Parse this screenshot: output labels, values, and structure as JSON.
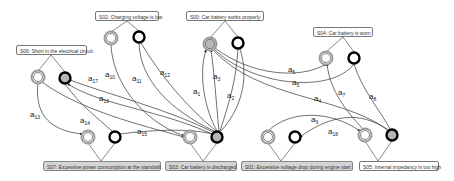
{
  "states": [
    {
      "id": "S00",
      "label": "S00: Car battery works properly",
      "box": {
        "x": 186,
        "y": 11,
        "w": 78
      },
      "style": "white"
    },
    {
      "id": "S02",
      "label": "S02: Charging voltage is low",
      "box": {
        "x": 95,
        "y": 11,
        "w": 64
      },
      "style": "white"
    },
    {
      "id": "S06",
      "label": "S06: Short in the electrical circuit",
      "box": {
        "x": 16,
        "y": 45,
        "w": 71
      },
      "style": "white"
    },
    {
      "id": "S04",
      "label": "S04: Car battery is worn",
      "box": {
        "x": 313,
        "y": 27,
        "w": 60
      },
      "style": "white"
    },
    {
      "id": "S07",
      "label": "S07: Excessive power consumption at the standstill",
      "box": {
        "x": 43,
        "y": 161,
        "w": 118
      },
      "style": "gray"
    },
    {
      "id": "S03",
      "label": "S03: Car battery is discharged",
      "box": {
        "x": 165,
        "y": 161,
        "w": 72
      },
      "style": "gray"
    },
    {
      "id": "S01",
      "label": "S01: Excessive voltage drop during engine start",
      "box": {
        "x": 241,
        "y": 161,
        "w": 112
      },
      "style": "gray"
    },
    {
      "id": "S05",
      "label": "S05: Internal impedancy is too high",
      "box": {
        "x": 359,
        "y": 161,
        "w": 80
      },
      "style": "white"
    }
  ],
  "nodes": [
    {
      "id": "S00-in",
      "cx": 210,
      "cy": 44,
      "type": "double-gray"
    },
    {
      "id": "S00-out",
      "cx": 238,
      "cy": 43,
      "type": "thick-white"
    },
    {
      "id": "S02-in",
      "cx": 111,
      "cy": 38,
      "type": "double-white"
    },
    {
      "id": "S02-out",
      "cx": 139,
      "cy": 37,
      "type": "thick-white"
    },
    {
      "id": "S06-in",
      "cx": 38,
      "cy": 77,
      "type": "double-white"
    },
    {
      "id": "S06-out",
      "cx": 65,
      "cy": 78,
      "type": "thick-gray"
    },
    {
      "id": "S04-in",
      "cx": 326,
      "cy": 58,
      "type": "double-white"
    },
    {
      "id": "S04-out",
      "cx": 354,
      "cy": 58,
      "type": "thick-white"
    },
    {
      "id": "S07-in",
      "cx": 88,
      "cy": 137,
      "type": "double-white"
    },
    {
      "id": "S07-out",
      "cx": 115,
      "cy": 137,
      "type": "thick-white"
    },
    {
      "id": "S03-in",
      "cx": 190,
      "cy": 137,
      "type": "double-white"
    },
    {
      "id": "S03-out",
      "cx": 217,
      "cy": 137,
      "type": "thick-gray"
    },
    {
      "id": "S01-in",
      "cx": 268,
      "cy": 137,
      "type": "double-white"
    },
    {
      "id": "S01-out",
      "cx": 295,
      "cy": 137,
      "type": "thick-white"
    },
    {
      "id": "S05-in",
      "cx": 365,
      "cy": 135,
      "type": "double-white"
    },
    {
      "id": "S05-out",
      "cx": 392,
      "cy": 135,
      "type": "thick-gray"
    }
  ],
  "edges": [
    {
      "name": "a1",
      "sub": "1",
      "lx": 193,
      "ly": 94
    },
    {
      "name": "a2",
      "sub": "2",
      "lx": 227,
      "ly": 98
    },
    {
      "name": "a3",
      "sub": "3",
      "lx": 213,
      "ly": 79
    },
    {
      "name": "a4",
      "sub": "4",
      "lx": 314,
      "ly": 101
    },
    {
      "name": "a5",
      "sub": "5",
      "lx": 292,
      "ly": 85
    },
    {
      "name": "a6",
      "sub": "6",
      "lx": 288,
      "ly": 72
    },
    {
      "name": "a7",
      "sub": "7",
      "lx": 338,
      "ly": 95
    },
    {
      "name": "a8",
      "sub": "8",
      "lx": 369,
      "ly": 99
    },
    {
      "name": "a9",
      "sub": "9",
      "lx": 311,
      "ly": 122
    },
    {
      "name": "a10",
      "sub": "10",
      "lx": 105,
      "ly": 77
    },
    {
      "name": "a11",
      "sub": "11",
      "lx": 132,
      "ly": 81
    },
    {
      "name": "a12",
      "sub": "12",
      "lx": 160,
      "ly": 75
    },
    {
      "name": "a13",
      "sub": "13",
      "lx": 30,
      "ly": 117
    },
    {
      "name": "a14",
      "sub": "14",
      "lx": 80,
      "ly": 123
    },
    {
      "name": "a15",
      "sub": "15",
      "lx": 137,
      "ly": 134
    },
    {
      "name": "a16",
      "sub": "16",
      "lx": 99,
      "ly": 101
    },
    {
      "name": "a17",
      "sub": "17",
      "lx": 88,
      "ly": 81
    },
    {
      "name": "a18",
      "sub": "18",
      "lx": 328,
      "ly": 134
    }
  ],
  "colors": {
    "stroke": "#222222",
    "ring_gray": "#999999",
    "fill_gray": "#b5b5b5",
    "label_gray_bg": "#d4d4d4"
  }
}
